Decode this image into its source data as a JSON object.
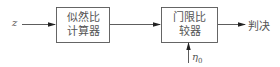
{
  "diagram": {
    "input_label": "z",
    "blocks": [
      {
        "id": "likelihood-ratio-calculator",
        "lines": [
          "似然比",
          "计算器"
        ]
      },
      {
        "id": "threshold-comparator",
        "lines": [
          "门限比",
          "较器"
        ]
      }
    ],
    "output_label": "判决",
    "threshold_label": {
      "symbol": "η",
      "subscript": "0"
    },
    "colors": {
      "line": "#333333",
      "box_border": "#555555",
      "text": "#555555"
    }
  }
}
